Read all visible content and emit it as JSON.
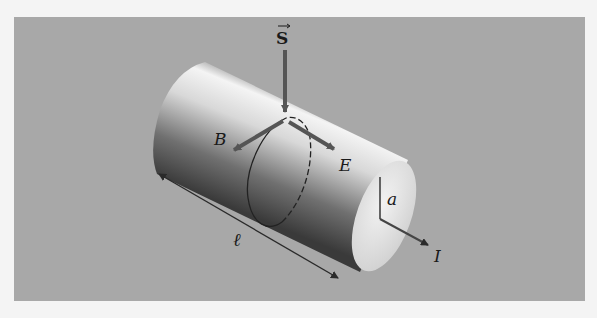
{
  "figure": {
    "labels": {
      "poynting": "S",
      "magnetic_field": "B",
      "electric_field": "E",
      "radius": "a",
      "current": "I",
      "length": "ℓ"
    },
    "colors": {
      "background": "#f4f4f4",
      "panel": "#a8a8a8",
      "arrow": "#555555",
      "line": "#2a2a2a"
    }
  }
}
